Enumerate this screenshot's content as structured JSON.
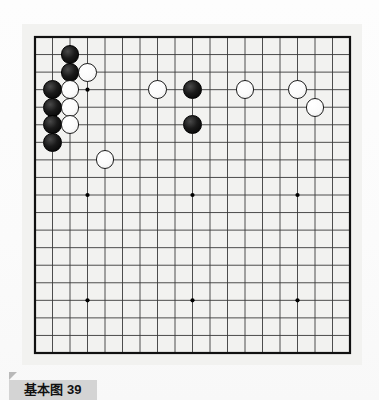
{
  "page": {
    "background_color": "#fdfdfd",
    "type": "go-problem-diagram"
  },
  "caption": {
    "label": "基本图 39",
    "tab_color": "#d4d4d4",
    "marker_color": "#b9b9b9"
  },
  "board": {
    "size": 19,
    "background_color": "#f2f2f0",
    "line_color": "#3a3a3a",
    "border_color": "#111111",
    "star_point_color": "#000000",
    "star_points": [
      {
        "col": 4,
        "row": 4
      },
      {
        "col": 10,
        "row": 4
      },
      {
        "col": 16,
        "row": 4
      },
      {
        "col": 4,
        "row": 10
      },
      {
        "col": 10,
        "row": 10
      },
      {
        "col": 16,
        "row": 10
      },
      {
        "col": 4,
        "row": 16
      },
      {
        "col": 10,
        "row": 16
      },
      {
        "col": 16,
        "row": 16
      }
    ],
    "black_color": "#000000",
    "white_color": "#ffffff",
    "stones": [
      {
        "color": "black",
        "col": 3,
        "row": 2
      },
      {
        "color": "black",
        "col": 3,
        "row": 3
      },
      {
        "color": "white",
        "col": 4,
        "row": 3
      },
      {
        "color": "black",
        "col": 2,
        "row": 4
      },
      {
        "color": "white",
        "col": 3,
        "row": 4
      },
      {
        "color": "black",
        "col": 2,
        "row": 5
      },
      {
        "color": "white",
        "col": 3,
        "row": 5
      },
      {
        "color": "black",
        "col": 2,
        "row": 6
      },
      {
        "color": "white",
        "col": 3,
        "row": 6
      },
      {
        "color": "black",
        "col": 2,
        "row": 7
      },
      {
        "color": "white",
        "col": 5,
        "row": 8
      },
      {
        "color": "white",
        "col": 8,
        "row": 4
      },
      {
        "color": "black",
        "col": 10,
        "row": 4
      },
      {
        "color": "black",
        "col": 10,
        "row": 6
      },
      {
        "color": "white",
        "col": 13,
        "row": 4
      },
      {
        "color": "white",
        "col": 16,
        "row": 4
      },
      {
        "color": "white",
        "col": 17,
        "row": 5
      }
    ]
  },
  "chart_data": {
    "type": "table",
    "title": "基本图 39",
    "categories": [
      "black",
      "white"
    ],
    "values": [
      7,
      10
    ]
  }
}
